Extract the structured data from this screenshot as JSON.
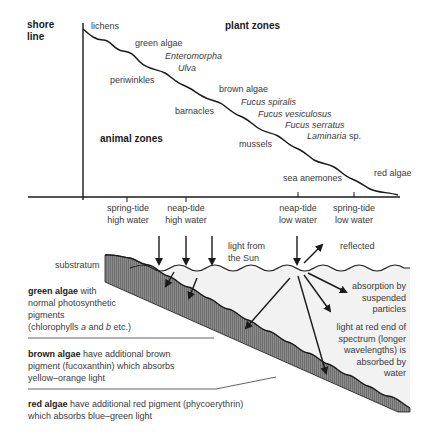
{
  "diagram": {
    "top": {
      "shore_line_label": "shore line",
      "shore_line_line1": "shore",
      "shore_line_line2": "line",
      "plant_zones_heading": "plant zones",
      "animal_zones_heading": "animal zones",
      "plant_labels": [
        {
          "text": "lichens",
          "italic": false
        },
        {
          "text": "green algae",
          "italic": false
        },
        {
          "text": "Enteromorpha",
          "italic": true
        },
        {
          "text": "Ulva",
          "italic": true
        },
        {
          "text": "brown algae",
          "italic": false
        },
        {
          "text": "Fucus spiralis",
          "italic": true
        },
        {
          "text": "Fucus vesiculosus",
          "italic": true
        },
        {
          "text": "Fucus serratus",
          "italic": true
        },
        {
          "text": "Laminaria",
          "italic": true,
          "suffix": " sp."
        },
        {
          "text": "red algae",
          "italic": false
        }
      ],
      "animal_labels": [
        "periwinkles",
        "barnacles",
        "mussels",
        "sea anemones"
      ],
      "tide_marks": [
        {
          "line1": "spring-tide",
          "line2": "high water"
        },
        {
          "line1": "neap-tide",
          "line2": "high water"
        },
        {
          "line1": "neap-tide",
          "line2": "low water"
        },
        {
          "line1": "spring-tide",
          "line2": "low water"
        }
      ]
    },
    "bottom": {
      "substratum_label": "substratum",
      "light_from_sun_line1": "light from",
      "light_from_sun_line2": "the Sun",
      "reflected_label": "reflected",
      "absorption_label": [
        "absorption by",
        "suspended",
        "particles"
      ],
      "red_end_label": [
        "light at red end of",
        "spectrum (longer",
        "wavelengths) is",
        "absorbed by",
        "water"
      ],
      "descriptions": [
        {
          "bold": "green algae",
          "rest_line1": " with",
          "lines": [
            "normal photosynthetic",
            "pigments"
          ],
          "last_pre": "(chlorophylls ",
          "a": "a",
          "mid": " and ",
          "b": "b",
          "post": " etc.)"
        },
        {
          "bold": "brown algae",
          "rest_line1": " have additional brown",
          "lines": [
            "pigment (fucoxanthin) which absorbs",
            "yellow–orange light"
          ]
        },
        {
          "bold": "red algae",
          "rest_line1": " have additional red pigment (phycoerythrin)",
          "lines": [
            "which absorbs blue–green light"
          ]
        }
      ]
    },
    "colors": {
      "line": "#1a1a1a",
      "text": "#3a3a3a",
      "water": "#f0f0f0",
      "substratum": "#8a8a8a"
    }
  }
}
